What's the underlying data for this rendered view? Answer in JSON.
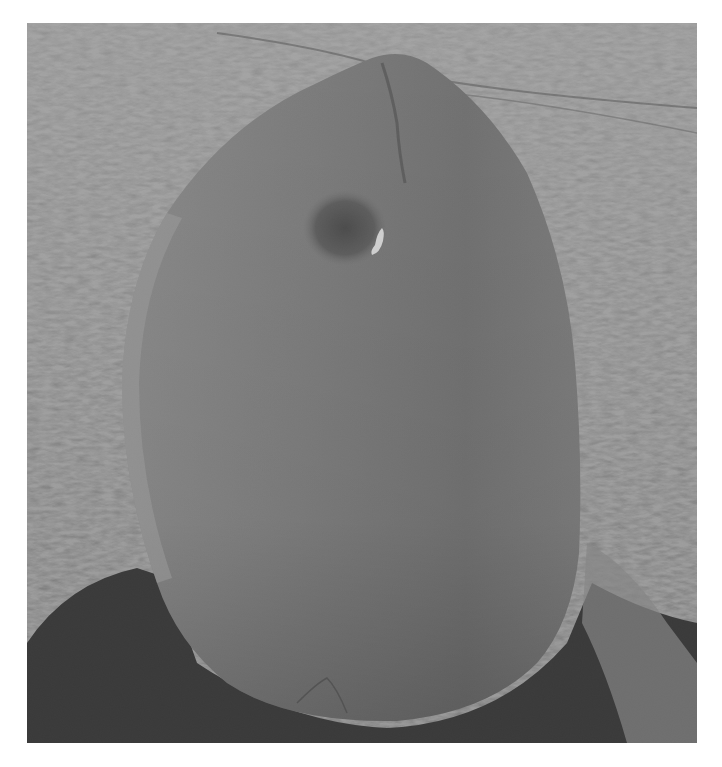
{
  "image": {
    "subject": "standing stone with hole in grassy field",
    "alt": "Black and white photograph of a tall rounded standing stone with a small hole near its top, set in an open grassy field",
    "colors": {
      "background": "#ffffff",
      "grass": "#8c8c8c",
      "stone": "#7a7a7a",
      "stone_highlight": "#9a9a9a",
      "shadow": "#2a2a2a",
      "hole_light": "#e8e8e8"
    }
  }
}
